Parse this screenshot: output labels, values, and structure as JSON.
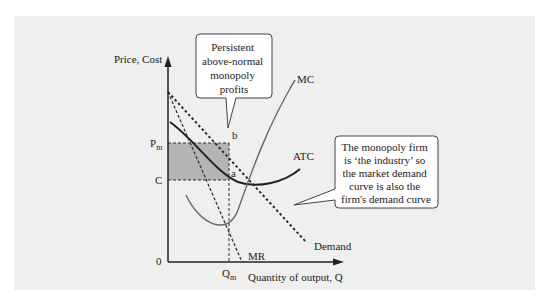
{
  "diagram": {
    "type": "monopoly-equilibrium",
    "y_axis_label": "Price, Cost",
    "x_axis_label": "Quantity of output, Q",
    "origin_label": "0",
    "price_label": "P",
    "price_sub": "m",
    "cost_label": "C",
    "quantity_label": "Q",
    "quantity_sub": "m",
    "point_b": "b",
    "point_a": "a",
    "curves": {
      "mc": "MC",
      "atc": "ATC",
      "mr": "MR",
      "demand": "Demand"
    },
    "callouts": [
      {
        "lines": [
          "Persistent",
          "above-normal",
          "monopoly",
          "profits"
        ]
      },
      {
        "lines": [
          "The monopoly firm",
          "is ‘the industry’ so",
          "the market demand",
          "curve is also the",
          "firm's demand curve"
        ]
      }
    ],
    "colors": {
      "panel": "#efefef",
      "profit_area": "#b4b4b4",
      "ink": "#2a2a2a",
      "curve_gray": "#666666"
    }
  }
}
